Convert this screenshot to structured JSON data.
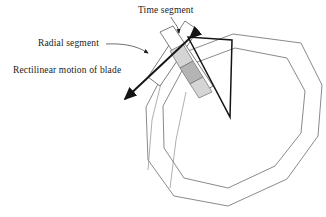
{
  "figure": {
    "background_color": "#ffffff",
    "labels": {
      "time_segment": "Time segment",
      "radial_segment": "Radial segment",
      "rectilinear_motion": "Rectilinear motion of blade"
    },
    "colors": {
      "polygon_stroke": "#7d7d7d",
      "wedge_stroke": "#141414",
      "arrow_stroke": "#141414",
      "leader_stroke": "#4a4a4a",
      "strip_fill": "#ffffff",
      "strip_stroke": "#555555",
      "cell_fill_light": "#d5d5d5",
      "cell_fill_dark": "#b4b4b4",
      "text_color": "#1b1b1b"
    },
    "geometry": {
      "outer_polygon_label": "outer decagon",
      "inner_polygon_label": "inner decagon",
      "outer_polygon_points": "233,34 301,43 322,85 318,136 287,179 228,206 174,196 148,160 146,107 172,57",
      "inner_polygon_points": "235,48 287,58 305,91 301,133 275,166 228,188 184,178 164,148 163,106 184,67",
      "wedge_points": "188,37 230,117 232,40",
      "wedge_apex": "230,117",
      "radial_strip_points": "160,32 173,26 213,86 200,94",
      "time_strip_points": "185,21 198,30 160,86 148,77",
      "shaded_cells": [
        {
          "points": "170,51 183,44 193,61 180,68",
          "shade": "light"
        },
        {
          "points": "180,68 193,61 203,77 190,84",
          "shade": "dark"
        },
        {
          "points": "190,84 203,77 212,92 199,98",
          "shade": "light"
        }
      ],
      "motion_arrow": {
        "from": "189,39",
        "to": "124,100",
        "double_headed": true,
        "description": "double-headed black arrow indicating rectilinear blade motion"
      },
      "leaders": [
        {
          "name": "time-segment-leader",
          "path": "M171,17 C174,24 178,24 179,34",
          "arrow_at": "179,40"
        },
        {
          "name": "radial-segment-leader",
          "path": "M106,44 C128,44 140,48 147,52",
          "arrow_at": "153,55"
        },
        {
          "name": "rectilinear-leader",
          "path": "M131,72 L141,62",
          "arrow_at": "0,0"
        }
      ],
      "thin_guides": [
        "M166,63 L152,120 L148,170",
        "M186,92 L176,140 L170,188"
      ]
    }
  }
}
